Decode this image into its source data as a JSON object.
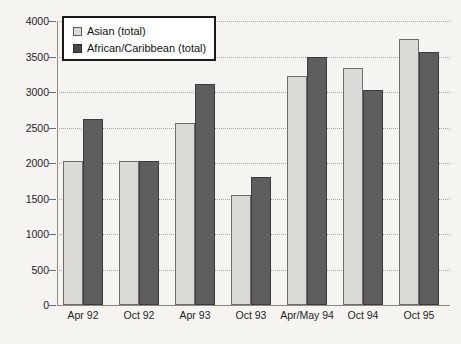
{
  "chart_data": {
    "type": "bar",
    "title": "",
    "xlabel": "",
    "ylabel": "",
    "ylim": [
      0,
      4000
    ],
    "ytick_step": 500,
    "yticks": [
      "0",
      "500",
      "1000",
      "1500",
      "2000",
      "2500",
      "3000",
      "3500",
      "4000"
    ],
    "grid": true,
    "legend_position": "top-left",
    "categories": [
      "Apr 92",
      "Oct 92",
      "Apr 93",
      "Oct 93",
      "Apr/May 94",
      "Oct 94",
      "Oct 95"
    ],
    "series": [
      {
        "name": "Asian (total)",
        "color": "#dcdad7",
        "values": [
          2030,
          2030,
          2560,
          1550,
          3230,
          3340,
          3740
        ]
      },
      {
        "name": "African/Caribbean (total)",
        "color": "#5f5e5c",
        "values": [
          2620,
          2030,
          3110,
          1800,
          3490,
          3030,
          3570
        ]
      }
    ]
  },
  "legend": {
    "entries": [
      {
        "label": "Asian (total)",
        "swatch": "asian"
      },
      {
        "label": "African/Caribbean (total)",
        "swatch": "afcar"
      }
    ]
  }
}
